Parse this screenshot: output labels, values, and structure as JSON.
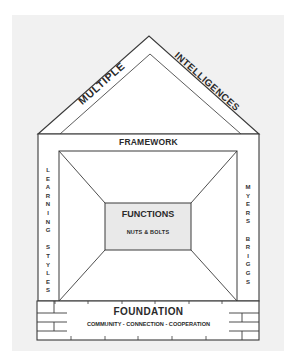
{
  "diagram": {
    "roof": {
      "left_label": "MULTIPLE",
      "right_label": "INTELLIGENCES"
    },
    "framework": {
      "label": "FRAMEWORK"
    },
    "left_wall": {
      "label": "LEARNING STYLES",
      "letters": [
        "L",
        "E",
        "A",
        "R",
        "N",
        "I",
        "N",
        "G",
        "",
        "S",
        "T",
        "Y",
        "L",
        "E",
        "S"
      ]
    },
    "right_wall": {
      "label": "MYERS BRIGGS",
      "letters": [
        "M",
        "Y",
        "E",
        "R",
        "S",
        "",
        "B",
        "R",
        "I",
        "G",
        "G",
        "S"
      ]
    },
    "center": {
      "title": "FUNCTIONS",
      "subtitle": "NUTS & BOLTS"
    },
    "foundation": {
      "title": "FOUNDATION",
      "subtitle": "COMMUNITY - CONNECTION - COOPERATION"
    },
    "colors": {
      "line": "#3a3a3a",
      "paper": "#f1f1f1",
      "fill": "#ffffff",
      "center_fill": "#e9e9e9"
    }
  }
}
